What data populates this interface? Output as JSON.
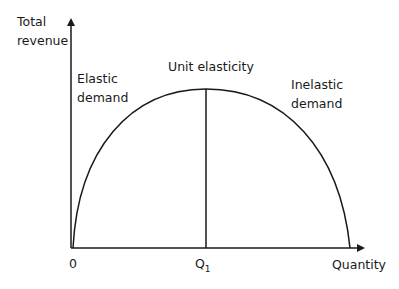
{
  "diagram": {
    "y_axis_label_line1": "Total",
    "y_axis_label_line2": "revenue",
    "x_axis_label": "Quantity",
    "origin_label": "0",
    "q1_label": "Q",
    "q1_subscript": "1",
    "regions": {
      "elastic_line1": "Elastic",
      "elastic_line2": "demand",
      "unit": "Unit elasticity",
      "inelastic_line1": "Inelastic",
      "inelastic_line2": "demand"
    },
    "colors": {
      "line": "#1a1a1a",
      "background": "#ffffff"
    }
  }
}
